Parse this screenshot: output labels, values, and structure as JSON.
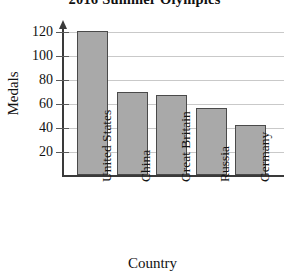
{
  "chart_data": {
    "type": "bar",
    "title": "2016 Summer Olympics",
    "xlabel": "Country",
    "ylabel": "Medals",
    "categories": [
      "United States",
      "China",
      "Great Britain",
      "Russia",
      "Germany"
    ],
    "values": [
      121,
      70,
      67,
      56,
      42
    ],
    "yticks": [
      20,
      40,
      60,
      80,
      100,
      120
    ],
    "ytick_labels": [
      "20",
      "40",
      "60",
      "80",
      "100",
      "120"
    ],
    "ylim": [
      0,
      130
    ],
    "grid": true,
    "legend": "none",
    "series": [
      {
        "name": "Medals",
        "values": [
          121,
          70,
          67,
          56,
          42
        ]
      }
    ],
    "colors": {
      "bar_fill": "#a9a9a9",
      "bar_stroke": "#4a4a4a",
      "gridline": "#c9c9c9",
      "axis": "#3a3a3a",
      "text": "#111111",
      "background": "#ffffff"
    }
  }
}
